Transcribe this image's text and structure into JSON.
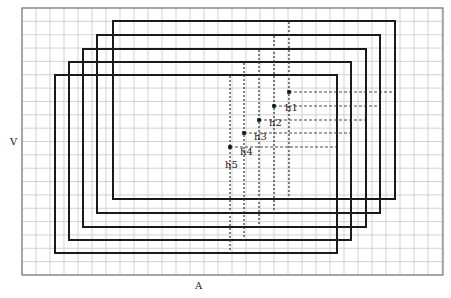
{
  "axes": {
    "x_label": "A",
    "y_label": "V"
  },
  "frame": {
    "x": 22,
    "y": 8,
    "w": 421,
    "h": 267,
    "grid_step": 14
  },
  "colors": {
    "grid": "#c8c8c8",
    "frame": "#7a7a7a",
    "rect": "#1a1a1a",
    "dash": "#333333"
  },
  "rectangles": [
    {
      "id": "r1",
      "x1": 113,
      "y1": 21,
      "x2": 395,
      "y2": 199
    },
    {
      "id": "r2",
      "x1": 97,
      "y1": 35,
      "x2": 380,
      "y2": 213
    },
    {
      "id": "r3",
      "x1": 83,
      "y1": 49,
      "x2": 366,
      "y2": 227
    },
    {
      "id": "r4",
      "x1": 69,
      "y1": 62,
      "x2": 351,
      "y2": 240
    },
    {
      "id": "r5",
      "x1": 55,
      "y1": 75,
      "x2": 337,
      "y2": 253
    }
  ],
  "points": [
    {
      "label": "h1",
      "x": 289,
      "y": 92,
      "vtop": 22,
      "vbot": 199,
      "hend": 394,
      "lx": 285,
      "ly": 111
    },
    {
      "label": "h2",
      "x": 274,
      "y": 106,
      "vtop": 36,
      "vbot": 213,
      "hend": 379,
      "lx": 269,
      "ly": 126
    },
    {
      "label": "h3",
      "x": 259,
      "y": 120,
      "vtop": 50,
      "vbot": 227,
      "hend": 365,
      "lx": 254,
      "ly": 140
    },
    {
      "label": "h4",
      "x": 244,
      "y": 133,
      "vtop": 63,
      "vbot": 240,
      "hend": 350,
      "lx": 240,
      "ly": 155
    },
    {
      "label": "h5",
      "x": 230,
      "y": 147,
      "vtop": 76,
      "vbot": 253,
      "hend": 336,
      "lx": 225,
      "ly": 168
    }
  ]
}
